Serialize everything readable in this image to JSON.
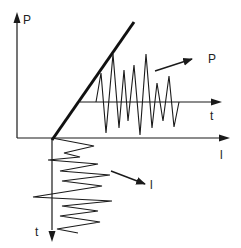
{
  "diagram": {
    "colors": {
      "stroke": "#1a1a1a",
      "background": "#ffffff"
    },
    "labels": {
      "p_axis": "P",
      "l_axis": "l",
      "t_axis_upper": "t",
      "t_axis_lower": "t",
      "p_signal": "P",
      "l_signal": "l"
    },
    "axes": {
      "p_axis": {
        "x1": 17,
        "y1": 138,
        "x2": 17,
        "y2": 22,
        "arrow_tip": [
          17,
          12
        ]
      },
      "l_axis": {
        "x1": 17,
        "y1": 138,
        "x2": 220,
        "y2": 138,
        "arrow_tip": [
          230,
          138
        ]
      },
      "t_axis_upper": {
        "x1": 80,
        "y1": 102,
        "x2": 212,
        "y2": 102,
        "arrow_tip": [
          222,
          102
        ]
      },
      "t_axis_lower": {
        "x1": 52,
        "y1": 138,
        "x2": 52,
        "y2": 230,
        "arrow_tip": [
          52,
          242
        ]
      }
    },
    "load_line": {
      "x1": 52,
      "y1": 140,
      "x2": 134,
      "y2": 22
    },
    "upper_signal_points": [
      [
        96,
        102
      ],
      [
        101,
        73
      ],
      [
        106,
        133
      ],
      [
        113,
        54
      ],
      [
        119,
        128
      ],
      [
        124,
        70
      ],
      [
        128,
        121
      ],
      [
        134,
        65
      ],
      [
        140,
        135
      ],
      [
        146,
        54
      ],
      [
        152,
        128
      ],
      [
        157,
        83
      ],
      [
        163,
        121
      ],
      [
        169,
        76
      ],
      [
        174,
        127
      ],
      [
        179,
        102
      ]
    ],
    "lower_signal_points": [
      [
        52,
        138
      ],
      [
        94,
        146
      ],
      [
        64,
        153
      ],
      [
        80,
        157
      ],
      [
        48,
        160
      ],
      [
        98,
        164
      ],
      [
        60,
        171
      ],
      [
        110,
        175
      ],
      [
        62,
        181
      ],
      [
        102,
        186
      ],
      [
        33,
        197
      ],
      [
        112,
        201
      ],
      [
        62,
        206
      ],
      [
        98,
        211
      ],
      [
        60,
        216
      ],
      [
        100,
        222
      ],
      [
        57,
        229
      ],
      [
        78,
        233
      ]
    ],
    "p_arrow": {
      "x1": 155,
      "y1": 71,
      "x2": 192,
      "y2": 59
    },
    "l_arrow": {
      "x1": 111,
      "y1": 171,
      "x2": 145,
      "y2": 184
    }
  }
}
